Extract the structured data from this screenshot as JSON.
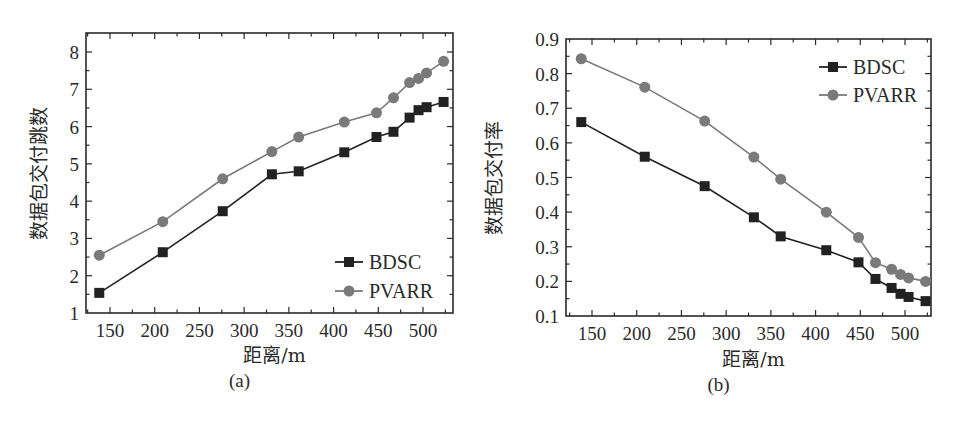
{
  "chart_data": [
    {
      "id": "a",
      "type": "line",
      "title": "",
      "caption": "(a)",
      "xlabel": "距离/m",
      "ylabel": "数据包交付跳数",
      "xlim": [
        125,
        530
      ],
      "ylim": [
        1,
        8.5
      ],
      "xticks": [
        150,
        200,
        250,
        300,
        350,
        400,
        450,
        500
      ],
      "yticks": [
        1,
        2,
        3,
        4,
        5,
        6,
        7,
        8
      ],
      "grid": false,
      "legend_position": "lower right",
      "x": [
        138,
        209,
        276,
        331,
        361,
        412,
        448,
        467,
        485,
        495,
        504,
        523
      ],
      "series": [
        {
          "name": "BDSC",
          "marker": "square",
          "color": "#222222",
          "values": [
            1.54,
            2.63,
            3.73,
            4.72,
            4.8,
            5.31,
            5.72,
            5.86,
            6.24,
            6.44,
            6.52,
            6.66
          ]
        },
        {
          "name": "PVARR",
          "marker": "circle",
          "color": "#7a7a7a",
          "values": [
            2.55,
            3.45,
            4.6,
            5.33,
            5.72,
            6.12,
            6.37,
            6.77,
            7.18,
            7.29,
            7.44,
            7.75
          ]
        }
      ]
    },
    {
      "id": "b",
      "type": "line",
      "title": "",
      "caption": "(b)",
      "xlabel": "距离/m",
      "ylabel": "数据包交付率",
      "xlim": [
        125,
        530
      ],
      "ylim": [
        0.1,
        0.9
      ],
      "xticks": [
        150,
        200,
        250,
        300,
        350,
        400,
        450,
        500
      ],
      "yticks": [
        0.1,
        0.2,
        0.3,
        0.4,
        0.5,
        0.6,
        0.7,
        0.8,
        0.9
      ],
      "grid": false,
      "legend_position": "upper right",
      "x": [
        138,
        209,
        276,
        331,
        361,
        412,
        448,
        467,
        485,
        495,
        504,
        523
      ],
      "series": [
        {
          "name": "BDSC",
          "marker": "square",
          "color": "#222222",
          "values": [
            0.66,
            0.56,
            0.475,
            0.385,
            0.33,
            0.29,
            0.255,
            0.207,
            0.181,
            0.164,
            0.155,
            0.143
          ]
        },
        {
          "name": "PVARR",
          "marker": "circle",
          "color": "#7a7a7a",
          "values": [
            0.843,
            0.761,
            0.663,
            0.559,
            0.495,
            0.4,
            0.327,
            0.254,
            0.235,
            0.22,
            0.21,
            0.2
          ]
        }
      ]
    }
  ]
}
